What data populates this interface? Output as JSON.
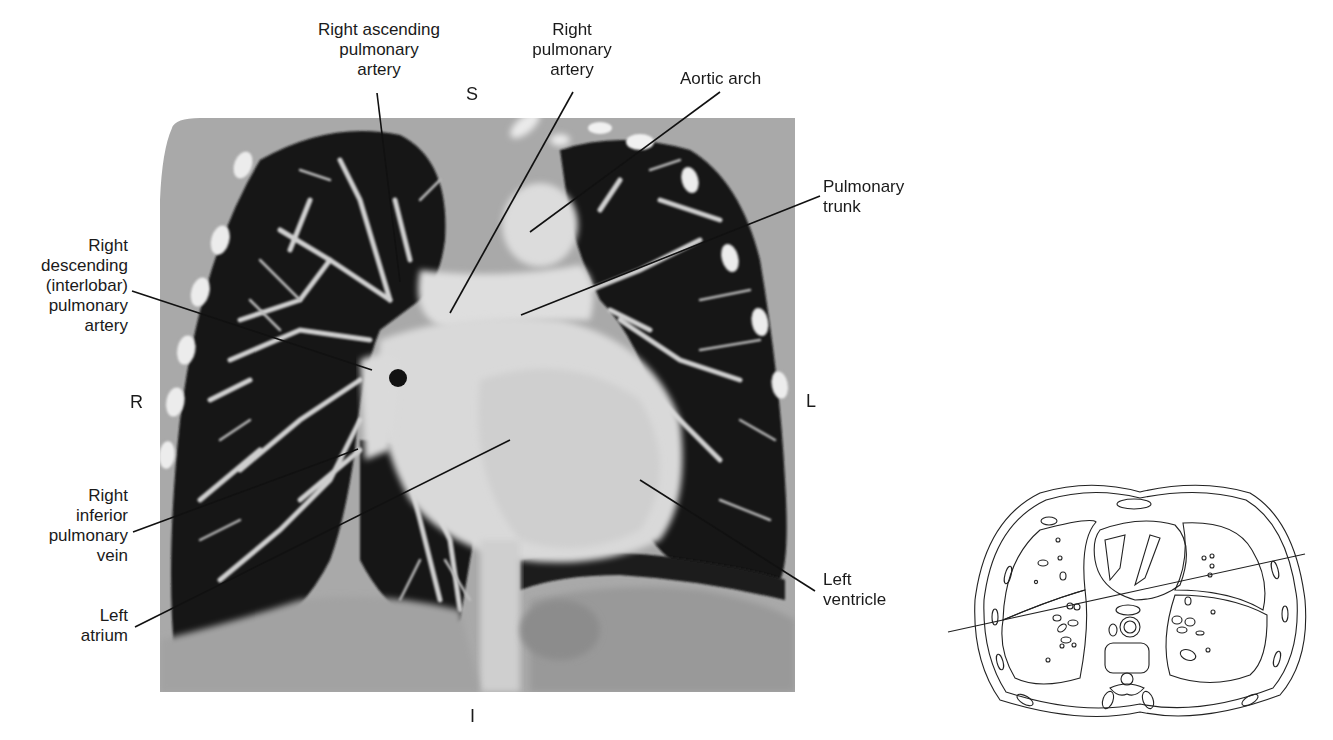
{
  "figure": {
    "type": "coronal CT angiogram of thorax with axial reference diagram",
    "orientation": {
      "superior": "S",
      "inferior": "I",
      "right": "R",
      "left": "L"
    },
    "labels": [
      {
        "id": "right-ascending-pulmonary-artery",
        "lines": [
          "Right ascending",
          "pulmonary",
          "artery"
        ]
      },
      {
        "id": "right-pulmonary-artery",
        "lines": [
          "Right",
          "pulmonary",
          "artery"
        ]
      },
      {
        "id": "aortic-arch",
        "lines": [
          "Aortic arch"
        ]
      },
      {
        "id": "pulmonary-trunk",
        "lines": [
          "Pulmonary",
          "trunk"
        ]
      },
      {
        "id": "right-descending-pulmonary-artery",
        "lines": [
          "Right",
          "descending",
          "(interlobar)",
          "pulmonary",
          "artery"
        ]
      },
      {
        "id": "right-inferior-pulmonary-vein",
        "lines": [
          "Right",
          "inferior",
          "pulmonary",
          "vein"
        ]
      },
      {
        "id": "left-atrium",
        "lines": [
          "Left",
          "atrium"
        ]
      },
      {
        "id": "left-ventricle",
        "lines": [
          "Left",
          "ventricle"
        ]
      }
    ]
  }
}
